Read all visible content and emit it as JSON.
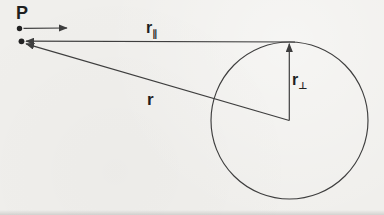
{
  "figure": {
    "labels": {
      "point": "P",
      "r": "r",
      "r_parallel": {
        "base": "r",
        "sub": "∥"
      },
      "r_perp": {
        "base": "r",
        "sub": "⊥"
      }
    },
    "colors": {
      "background": "#f0efec",
      "line": "#3e3e3e",
      "dot": "#222222",
      "text": "#1f1f1f"
    }
  }
}
